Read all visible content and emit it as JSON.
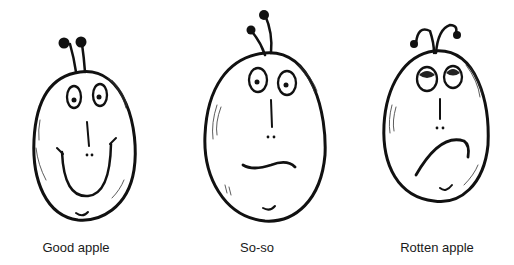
{
  "figures": [
    {
      "id": "good-apple",
      "label": "Good apple",
      "expression": "smile"
    },
    {
      "id": "so-so",
      "label": "So-so",
      "expression": "neutral"
    },
    {
      "id": "rotten-apple",
      "label": "Rotten apple",
      "expression": "frown"
    }
  ]
}
